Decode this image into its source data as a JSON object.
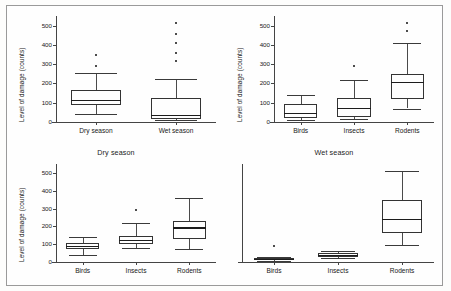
{
  "figure": {
    "background_color": "#fefefe",
    "frame_color": "#9a9a9a",
    "box_line_color": "#333333",
    "median_color": "#1c1c1c",
    "outlier_color": "#111111"
  },
  "chart_data": [
    {
      "type": "box",
      "panel_id": "top-left",
      "title": "",
      "xlabel": "",
      "ylabel": "Level of damage (counts)",
      "ylim": [
        0,
        550
      ],
      "yticks": [
        0,
        100,
        200,
        300,
        400,
        500
      ],
      "ytick_labels": [
        "0",
        "100",
        "200",
        "300",
        "400",
        "500"
      ],
      "grid": false,
      "legend": "none",
      "categories": [
        "Dry season",
        "Wet season"
      ],
      "boxes": [
        {
          "label": "Dry season",
          "min": 40,
          "q1": 88,
          "median": 113,
          "q3": 168,
          "max": 255,
          "outliers": [
            290,
            350
          ]
        },
        {
          "label": "Wet season",
          "min": 8,
          "q1": 18,
          "median": 35,
          "q3": 122,
          "max": 222,
          "outliers": [
            318,
            358,
            410,
            455,
            512
          ]
        }
      ]
    },
    {
      "type": "box",
      "panel_id": "top-right",
      "title": "",
      "xlabel": "",
      "ylabel": "Level of damage (counts)",
      "ylim": [
        0,
        550
      ],
      "yticks": [
        0,
        100,
        200,
        300,
        400,
        500
      ],
      "ytick_labels": [
        "0",
        "100",
        "200",
        "300",
        "400",
        "500"
      ],
      "grid": false,
      "legend": "none",
      "categories": [
        "Birds",
        "Insects",
        "Rodents"
      ],
      "boxes": [
        {
          "label": "Birds",
          "min": 8,
          "q1": 20,
          "median": 45,
          "q3": 95,
          "max": 140,
          "outliers": []
        },
        {
          "label": "Insects",
          "min": 15,
          "q1": 25,
          "median": 70,
          "q3": 122,
          "max": 218,
          "outliers": [
            288
          ]
        },
        {
          "label": "Rodents",
          "min": 70,
          "q1": 120,
          "median": 205,
          "q3": 248,
          "max": 412,
          "outliers": [
            470,
            512
          ]
        }
      ]
    },
    {
      "type": "box",
      "panel_id": "bottom-left",
      "title": "Dry season",
      "xlabel": "",
      "ylabel": "Level of damage (counts)",
      "ylim": [
        0,
        550
      ],
      "yticks": [
        0,
        100,
        200,
        300,
        400,
        500
      ],
      "ytick_labels": [
        "0",
        "100",
        "200",
        "300",
        "400",
        "500"
      ],
      "grid": false,
      "legend": "none",
      "categories": [
        "Birds",
        "Insects",
        "Rodents"
      ],
      "boxes": [
        {
          "label": "Birds",
          "min": 40,
          "q1": 72,
          "median": 88,
          "q3": 108,
          "max": 138,
          "outliers": []
        },
        {
          "label": "Insects",
          "min": 78,
          "q1": 102,
          "median": 120,
          "q3": 145,
          "max": 218,
          "outliers": [
            290
          ]
        },
        {
          "label": "Rodents",
          "min": 75,
          "q1": 128,
          "median": 190,
          "q3": 232,
          "max": 358,
          "outliers": []
        }
      ]
    },
    {
      "type": "box",
      "panel_id": "bottom-right",
      "title": "Wet season",
      "xlabel": "",
      "ylabel": "",
      "ylim": [
        0,
        550
      ],
      "yticks": [],
      "ytick_labels": [],
      "grid": false,
      "legend": "none",
      "categories": [
        "Birds",
        "Insects",
        "Rodents"
      ],
      "boxes": [
        {
          "label": "Birds",
          "min": 5,
          "q1": 10,
          "median": 14,
          "q3": 20,
          "max": 28,
          "outliers": [
            88
          ]
        },
        {
          "label": "Insects",
          "min": 22,
          "q1": 30,
          "median": 38,
          "q3": 48,
          "max": 62,
          "outliers": []
        },
        {
          "label": "Rodents",
          "min": 95,
          "q1": 160,
          "median": 240,
          "q3": 348,
          "max": 512,
          "outliers": []
        }
      ]
    }
  ]
}
